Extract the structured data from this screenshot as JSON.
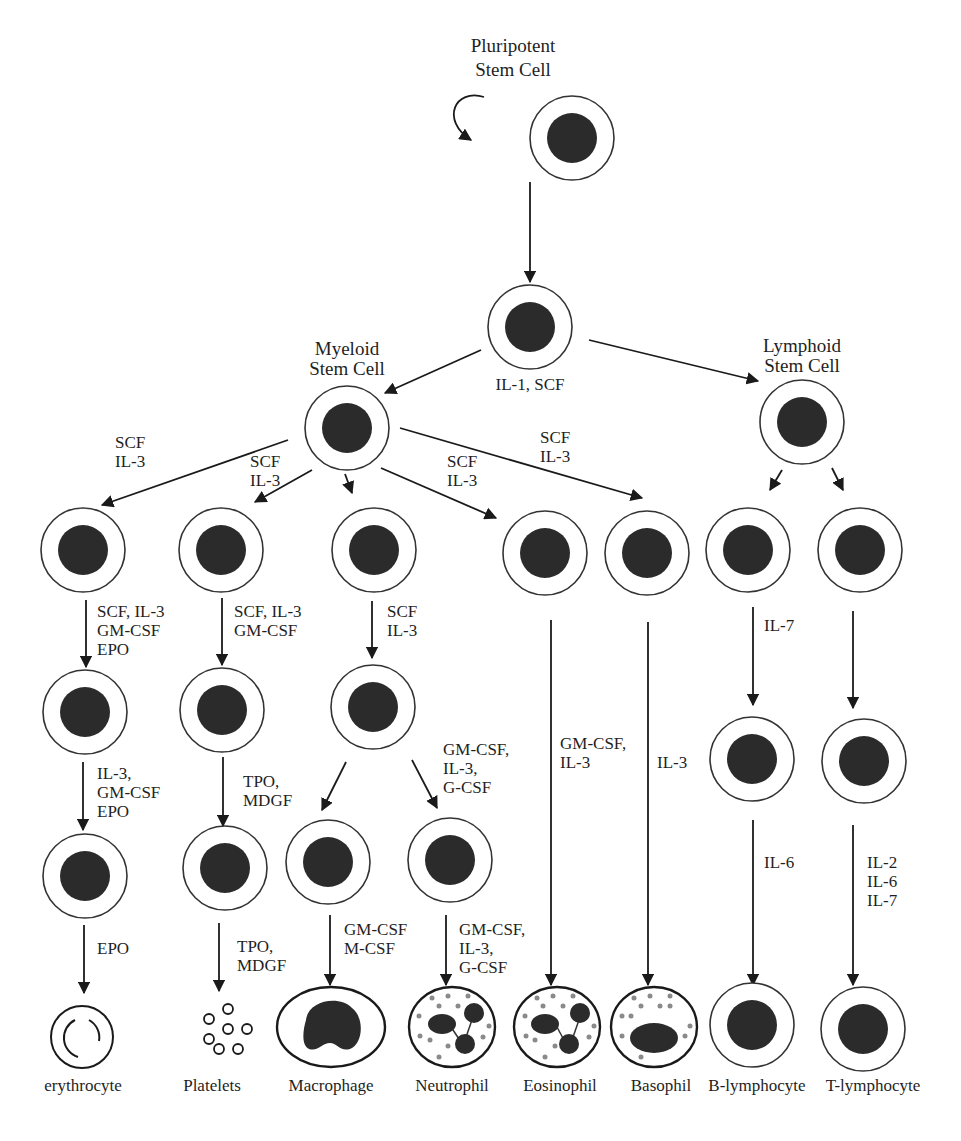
{
  "diagram": {
    "stem_cells": {
      "pluripotent": {
        "line1": "Pluripotent",
        "line2": "Stem Cell"
      },
      "myeloid": {
        "line1": "Myeloid",
        "line2": "Stem Cell"
      },
      "lymphoid": {
        "line1": "Lymphoid",
        "line2": "Stem Cell"
      }
    },
    "factors": {
      "progenitor": "IL-1, SCF",
      "to_erythroid": [
        "SCF",
        "IL-3"
      ],
      "to_megakaryocyte": [
        "SCF",
        "IL-3"
      ],
      "to_eosinophil": [
        "SCF",
        "IL-3"
      ],
      "to_basophil": [
        "SCF",
        "IL-3"
      ],
      "erythroid_step1": [
        "SCF, IL-3",
        "GM-CSF",
        "EPO"
      ],
      "erythroid_step2": [
        "IL-3,",
        "GM-CSF",
        "EPO"
      ],
      "erythroid_step3": [
        "EPO"
      ],
      "mega_step1": [
        "SCF, IL-3",
        "GM-CSF"
      ],
      "mega_step2": [
        "TPO,",
        "MDGF"
      ],
      "mega_step3": [
        "TPO,",
        "MDGF"
      ],
      "gm_step1": [
        "SCF",
        "IL-3"
      ],
      "neutro_branch": [
        "GM-CSF,",
        "IL-3,",
        "G-CSF"
      ],
      "macrophage_final": [
        "GM-CSF",
        "M-CSF"
      ],
      "neutrophil_final": [
        "GM-CSF,",
        "IL-3,",
        "G-CSF"
      ],
      "eosinophil_final": [
        "GM-CSF,",
        "IL-3"
      ],
      "basophil_final": [
        "IL-3"
      ],
      "b_step1": [
        "IL-7"
      ],
      "b_step2": [
        "IL-6"
      ],
      "t_step2": [
        "IL-2",
        "IL-6",
        "IL-7"
      ]
    },
    "final_cells": [
      {
        "id": "erythrocyte",
        "label": "erythrocyte"
      },
      {
        "id": "platelets",
        "label": "Platelets"
      },
      {
        "id": "macrophage",
        "label": "Macrophage"
      },
      {
        "id": "neutrophil",
        "label": "Neutrophil"
      },
      {
        "id": "eosinophil",
        "label": "Eosinophil"
      },
      {
        "id": "basophil",
        "label": "Basophil"
      },
      {
        "id": "b-lymphocyte",
        "label": "B-lymphocyte"
      },
      {
        "id": "t-lymphocyte",
        "label": "T-lymphocyte"
      }
    ],
    "colors": {
      "nucleus": "#2b2b2b",
      "membrane": "#333333",
      "granule": "#8a8a8a",
      "background": "#ffffff"
    }
  }
}
